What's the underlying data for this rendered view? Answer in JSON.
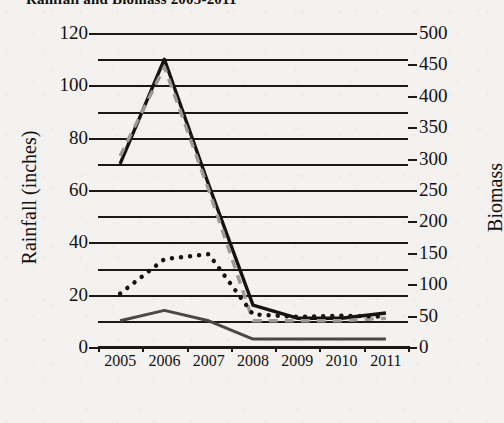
{
  "chart_data": {
    "type": "line",
    "title": "Rainfall and Biomass 2005-2011",
    "xlabel": "",
    "ylabel": "Rainfall (inches)",
    "y2label": "Biomass",
    "x": [
      "2005",
      "2006",
      "2007",
      "2008",
      "2009",
      "2010",
      "2011"
    ],
    "categories": [
      "2005",
      "2006",
      "2007",
      "2008",
      "2009",
      "2010",
      "2011"
    ],
    "xtick_labels": [
      "2005",
      "2006",
      "2007",
      "2008",
      "2009",
      "2010",
      "2011"
    ],
    "ylim": [
      0,
      120
    ],
    "ytick_labels": [
      "0",
      "20",
      "40",
      "60",
      "80",
      "100",
      "120"
    ],
    "ytick_values": [
      0,
      20,
      40,
      60,
      80,
      100,
      120
    ],
    "ygrid_values": [
      0,
      10,
      20,
      30,
      40,
      50,
      60,
      70,
      80,
      90,
      100,
      110,
      120
    ],
    "y2lim": [
      0,
      500
    ],
    "y2tick_labels": [
      "0",
      "50",
      "100",
      "150",
      "200",
      "250",
      "300",
      "350",
      "400",
      "450",
      "500"
    ],
    "y2tick_values": [
      0,
      50,
      100,
      150,
      200,
      250,
      300,
      350,
      400,
      450,
      500
    ],
    "grid": true,
    "legend": "none",
    "series": [
      {
        "name": "rainfall-solid-black",
        "axis": "left",
        "style": "solid",
        "color": "#161412",
        "width": 3.4,
        "values": [
          70,
          110,
          62,
          16,
          11,
          11,
          13
        ]
      },
      {
        "name": "rainfall-dashed-gray",
        "axis": "left",
        "style": "dashed",
        "color": "#9b9a97",
        "width": 3.4,
        "values": [
          73,
          107,
          60,
          10,
          10,
          10,
          11
        ]
      },
      {
        "name": "biomass-dotted-black",
        "axis": "right",
        "style": "dotted",
        "color": "#161412",
        "width": 4.4,
        "values": [
          85,
          140,
          148,
          52,
          48,
          50,
          48
        ]
      },
      {
        "name": "biomass-solid-gray",
        "axis": "left",
        "style": "solid",
        "color": "#4a4845",
        "width": 3.0,
        "values": [
          10,
          14,
          10,
          3,
          3,
          3,
          3
        ]
      }
    ]
  }
}
